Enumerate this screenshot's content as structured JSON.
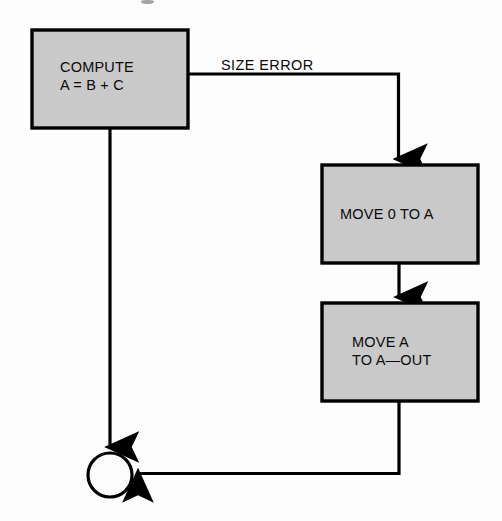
{
  "diagram": {
    "background_color": "#fdfdfd",
    "node_fill_color": "#c9c9c9",
    "stroke_color": "#000000",
    "nodes": [
      {
        "id": "compute",
        "shape": "process-box",
        "label_line1": "COMPUTE",
        "label_line2": "A = B + C",
        "x": 32,
        "y": 30,
        "width": 156,
        "height": 98
      },
      {
        "id": "move-zero-to-a",
        "shape": "process-box",
        "label": "MOVE 0 TO A",
        "x": 322,
        "y": 165,
        "width": 156,
        "height": 98
      },
      {
        "id": "move-a-to-a-out",
        "shape": "process-box",
        "label_line1": "MOVE A",
        "label_line2": "TO A—OUT",
        "x": 322,
        "y": 303,
        "width": 156,
        "height": 98
      },
      {
        "id": "connector",
        "shape": "circle-connector",
        "label": "",
        "cx": 110,
        "cy": 475,
        "r": 22
      }
    ],
    "edges": [
      {
        "id": "compute-to-move-zero",
        "from": "compute",
        "to": "move-zero-to-a",
        "label": "SIZE ERROR",
        "routing": "right-then-down",
        "arrowhead": true
      },
      {
        "id": "move-zero-to-move-a",
        "from": "move-zero-to-a",
        "to": "move-a-to-a-out",
        "label": "",
        "routing": "down",
        "arrowhead": true
      },
      {
        "id": "move-a-to-connector",
        "from": "move-a-to-a-out",
        "to": "connector",
        "label": "",
        "routing": "down-then-left",
        "arrowhead": true
      },
      {
        "id": "compute-to-connector",
        "from": "compute",
        "to": "connector",
        "label": "",
        "routing": "down",
        "arrowhead": true
      }
    ]
  }
}
